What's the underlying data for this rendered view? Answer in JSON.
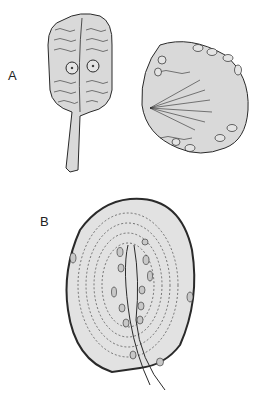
{
  "figure": {
    "panels": [
      {
        "label": "A",
        "description": "Two cell illustrations: a club-shaped cell with stalk and two nuclei, and a rounded cell with radiating fibers and peripheral nuclei"
      },
      {
        "label": "B",
        "description": "Oval lamellated corpuscle with concentric dashed layers, central axon and nuclei, nerve fiber exiting at bottom"
      }
    ],
    "colors": {
      "fill": "#d9d9d9",
      "stroke": "#2a2a2a",
      "background": "#ffffff"
    }
  }
}
